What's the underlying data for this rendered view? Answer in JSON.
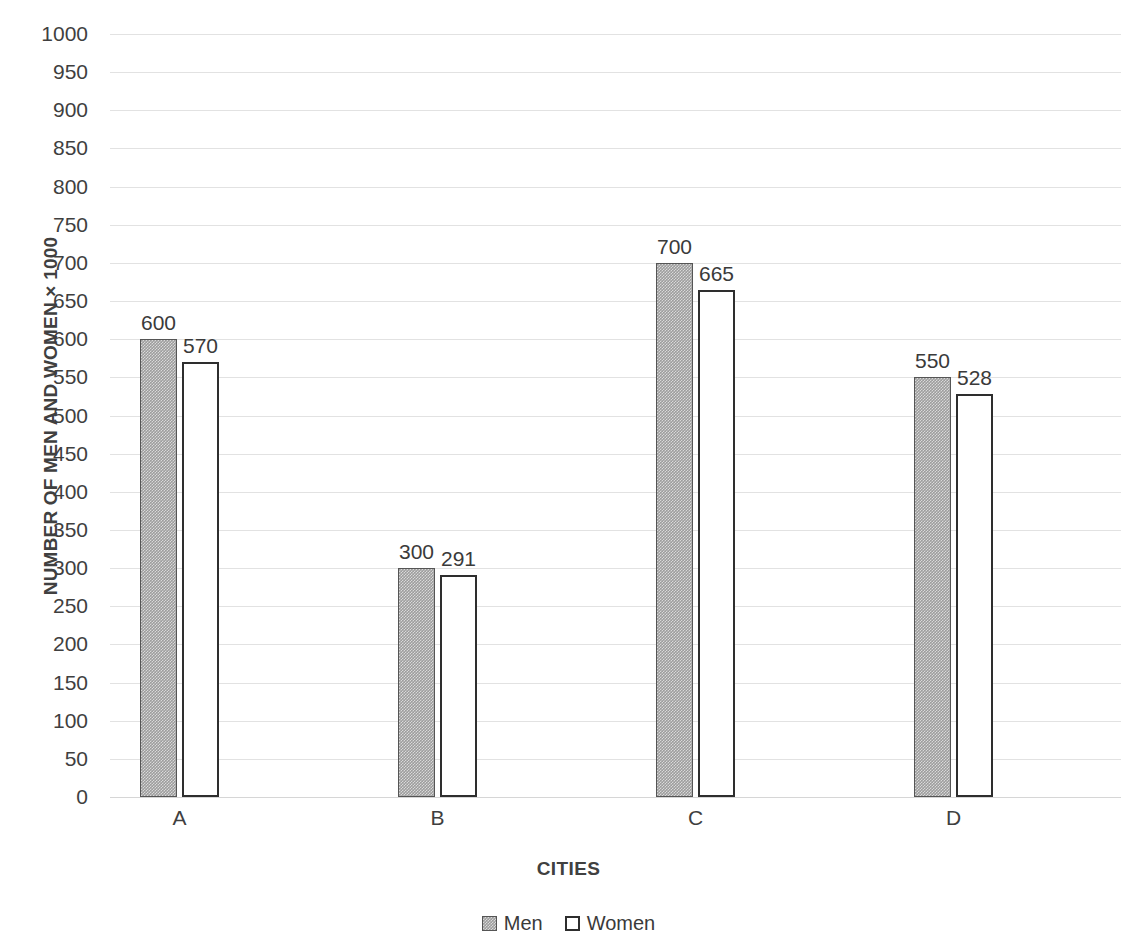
{
  "chart_data": {
    "type": "bar",
    "title": "",
    "categories": [
      "A",
      "B",
      "C",
      "D"
    ],
    "series": [
      {
        "name": "Men",
        "values": [
          600,
          300,
          700,
          550
        ],
        "color": "#9d9d9d"
      },
      {
        "name": "Women",
        "values": [
          570,
          291,
          665,
          528
        ],
        "color": "#ffffff"
      }
    ],
    "xlabel": "CITIES",
    "ylabel": "NUMBER OF MEN AND WOMEN × 1000",
    "ylim": [
      0,
      1000
    ],
    "ytick_step": 50,
    "yticks": [
      1000,
      950,
      900,
      850,
      800,
      750,
      700,
      650,
      600,
      550,
      500,
      450,
      400,
      350,
      300,
      250,
      200,
      150,
      100,
      50,
      0
    ],
    "ytick_labels": [
      "1000",
      "950",
      "900",
      "850",
      "800",
      "750",
      "700",
      "650",
      "600",
      "550",
      "500",
      "450",
      "400",
      "350",
      "300",
      "250",
      "200",
      "150",
      "100",
      "50",
      "0"
    ],
    "grid": true,
    "grid_color": "#e2e2e2",
    "legend_position": "bottom",
    "data_labels": [
      {
        "category": "A",
        "series": "Men",
        "value": 600
      },
      {
        "category": "A",
        "series": "Women",
        "value": 570
      },
      {
        "category": "B",
        "series": "Men",
        "value": 300
      },
      {
        "category": "B",
        "series": "Women",
        "value": 291
      },
      {
        "category": "C",
        "series": "Men",
        "value": 700
      },
      {
        "category": "C",
        "series": "Women",
        "value": 665
      },
      {
        "category": "D",
        "series": "Men",
        "value": 550
      },
      {
        "category": "D",
        "series": "Women",
        "value": 528
      }
    ]
  },
  "legend": {
    "items": [
      {
        "label": "Men",
        "swatch": "filled-gray-square"
      },
      {
        "label": "Women",
        "swatch": "outlined-white-square"
      }
    ]
  },
  "axes": {
    "x_title": "CITIES",
    "y_title": "NUMBER OF MEN AND WOMEN × 1000"
  }
}
